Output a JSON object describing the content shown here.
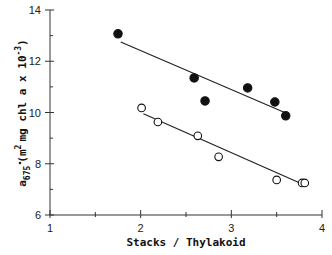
{
  "chart_data": {
    "type": "scatter",
    "title": "",
    "xlabel": "Stacks / Thylakoid",
    "ylabel": "a*675 (m2 mg chl a x 10-3)",
    "xlim": [
      1,
      4
    ],
    "ylim": [
      6,
      14
    ],
    "xticks": [
      1,
      2,
      3,
      4
    ],
    "yticks": [
      6,
      8,
      10,
      12,
      14
    ],
    "grid": false,
    "legend": "none",
    "series": [
      {
        "name": "filled",
        "marker": "filled-circle",
        "points": [
          [
            1.75,
            13.07
          ],
          [
            2.59,
            11.35
          ],
          [
            2.71,
            10.45
          ],
          [
            3.18,
            10.96
          ],
          [
            3.48,
            10.41
          ],
          [
            3.6,
            9.87
          ]
        ],
        "fit_line": [
          [
            1.78,
            12.75
          ],
          [
            3.62,
            9.95
          ]
        ]
      },
      {
        "name": "open",
        "marker": "open-circle",
        "points": [
          [
            2.01,
            10.18
          ],
          [
            2.19,
            9.63
          ],
          [
            2.63,
            9.09
          ],
          [
            2.86,
            8.27
          ],
          [
            3.5,
            7.37
          ],
          [
            3.78,
            7.25
          ],
          [
            3.81,
            7.25
          ]
        ],
        "fit_line": [
          [
            2.03,
            9.95
          ],
          [
            3.8,
            7.18
          ]
        ]
      }
    ]
  },
  "axes": {
    "x_title": "Stacks / Thylakoid",
    "y_title_main": "a",
    "y_title_sub": "675",
    "y_title_rest": "(m",
    "y_title_sup": "2",
    "y_title_end": "mg chl a x 10",
    "y_title_exp": "-3",
    "y_title_close": ")",
    "x_ticks": [
      "1",
      "2",
      "3",
      "4"
    ],
    "y_ticks": [
      "6",
      "8",
      "10",
      "12",
      "14"
    ]
  }
}
